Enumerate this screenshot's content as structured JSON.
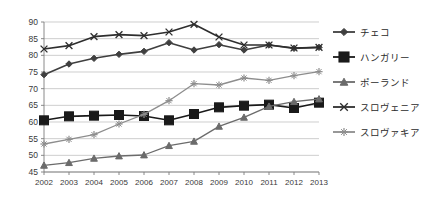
{
  "chart_data": {
    "type": "line",
    "title": "",
    "xlabel": "",
    "ylabel": "",
    "x": [
      2002,
      2003,
      2004,
      2005,
      2006,
      2007,
      2008,
      2009,
      2010,
      2011,
      2012,
      2013
    ],
    "xtick_labels": [
      "2002",
      "2003",
      "2004",
      "2005",
      "2006",
      "2007",
      "2008",
      "2009",
      "2010",
      "2011",
      "2012",
      "2013"
    ],
    "ylim": [
      45,
      90
    ],
    "ytick_labels": [
      "45",
      "50",
      "55",
      "60",
      "65",
      "70",
      "75",
      "80",
      "85",
      "90"
    ],
    "yticks": [
      45,
      50,
      55,
      60,
      65,
      70,
      75,
      80,
      85,
      90
    ],
    "grid": true,
    "legend_position": "right",
    "series": [
      {
        "name": "チェコ",
        "marker": "diamond",
        "color": "#3f3f3f",
        "values": [
          74.2,
          77.4,
          79.1,
          80.3,
          81.2,
          83.8,
          81.6,
          83.2,
          81.6,
          83.1,
          82.1,
          82.4
        ]
      },
      {
        "name": "ハンガリー",
        "marker": "square",
        "color": "#1a1a1a",
        "values": [
          60.5,
          61.7,
          61.9,
          62.1,
          61.8,
          60.5,
          62.4,
          64.4,
          64.9,
          65.2,
          64.2,
          65.8
        ]
      },
      {
        "name": "ポーランド",
        "marker": "triangle",
        "color": "#6b6b6b",
        "values": [
          47.0,
          47.8,
          49.1,
          49.8,
          50.1,
          52.9,
          54.2,
          58.7,
          61.4,
          64.7,
          66.1,
          66.9
        ]
      },
      {
        "name": "スロヴェニア",
        "marker": "x",
        "color": "#2e2e2e",
        "values": [
          81.9,
          82.9,
          85.6,
          86.2,
          85.9,
          87.0,
          89.3,
          85.5,
          83.1,
          83.1,
          82.2,
          82.4
        ]
      },
      {
        "name": "スロヴァキア",
        "marker": "plus",
        "color": "#8d8d8d",
        "values": [
          53.4,
          54.8,
          56.2,
          59.4,
          62.3,
          66.4,
          71.5,
          71.1,
          73.2,
          72.5,
          73.9,
          75.1
        ]
      }
    ]
  },
  "legend": {
    "items": [
      {
        "label": "チェコ"
      },
      {
        "label": "ハンガリー"
      },
      {
        "label": "ポーランド"
      },
      {
        "label": "スロヴェニア"
      },
      {
        "label": "スロヴァキア"
      }
    ]
  }
}
